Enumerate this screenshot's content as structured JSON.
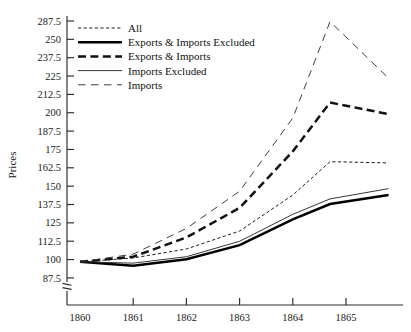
{
  "chart_data": {
    "type": "line",
    "title": "",
    "xlabel": "",
    "ylabel": "Prices",
    "xlim": [
      1860,
      1866
    ],
    "ylim": [
      87.5,
      287.5
    ],
    "grid": false,
    "legend_position": "top-left inside",
    "axis_break": true,
    "x_ticks": [
      "1860",
      "1861",
      "1862",
      "1863",
      "1864",
      "1865"
    ],
    "x_tick_values": [
      1860,
      1861,
      1862,
      1863,
      1864,
      1865
    ],
    "y_ticks": [
      "287.5",
      "250",
      "237.5",
      "225",
      "212.5",
      "200",
      "187.5",
      "175",
      "162.5",
      "150",
      "137.5",
      "125",
      "112.5",
      "100",
      "87.5"
    ],
    "y_tick_values": [
      287.5,
      275,
      262.5,
      250,
      237.5,
      225,
      212.5,
      200,
      187.5,
      175,
      162.5,
      150,
      137.5,
      125,
      112.5
    ],
    "x": [
      1860,
      1861,
      1862,
      1863,
      1864,
      1864.7,
      1865.8
    ],
    "series": [
      {
        "name": "All",
        "style": "dotted",
        "width": "thin",
        "color": "#111111",
        "values": [
          100,
          103,
          110,
          124,
          152,
          178,
          177
        ]
      },
      {
        "name": "Exports & Imports Excluded",
        "style": "solid",
        "width": "thick",
        "color": "#000000",
        "values": [
          100,
          97,
          102,
          113,
          133,
          145,
          152
        ]
      },
      {
        "name": "Exports & Imports",
        "style": "dashed",
        "width": "thick",
        "color": "#111111",
        "values": [
          100,
          104,
          119,
          142,
          186,
          224,
          215
        ]
      },
      {
        "name": "Imports Excluded",
        "style": "solid",
        "width": "thin",
        "color": "#2b2b2b",
        "values": [
          100,
          99,
          104,
          116,
          137,
          149,
          157
        ]
      },
      {
        "name": "Imports",
        "style": "longdash",
        "width": "thin",
        "color": "#333333",
        "values": [
          100,
          106,
          126,
          155,
          212,
          287,
          243
        ]
      }
    ]
  },
  "legend": {
    "items": [
      {
        "label": "All"
      },
      {
        "label": "Exports & Imports Excluded"
      },
      {
        "label": "Exports & Imports"
      },
      {
        "label": "Imports Excluded"
      },
      {
        "label": "Imports"
      }
    ]
  }
}
